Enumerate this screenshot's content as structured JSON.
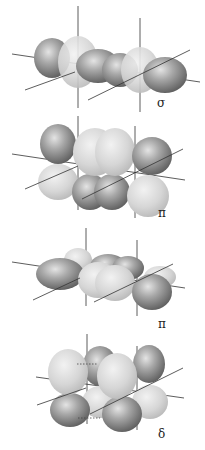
{
  "colors": {
    "dark_lobe": "#8a8a8a",
    "light_lobe": "#d4d4d4",
    "axis": "#333333",
    "background": "#ffffff"
  },
  "panels": [
    {
      "id": "sigma",
      "label": "σ",
      "description": "sigma bond: end-on overlap of lobes along internuclear axis"
    },
    {
      "id": "pi-1",
      "label": "π",
      "description": "pi bond: side-on overlap of p/d lobes above and below axis"
    },
    {
      "id": "pi-2",
      "label": "π",
      "description": "pi bond: side-on overlap viewed from alternate orientation"
    },
    {
      "id": "delta",
      "label": "δ",
      "description": "delta bond: four-lobe face-to-face overlap of d orbitals"
    }
  ]
}
